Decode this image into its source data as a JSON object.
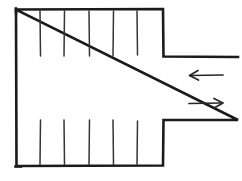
{
  "figure": {
    "style": "hand-drawn line sketch",
    "background_color": "#ffffff",
    "line_color": "#1b1b1b",
    "fin_color": "#343434",
    "arrow_color": "#262626",
    "canvas": {
      "width": 242,
      "height": 181
    }
  },
  "body_outline": {
    "name": "plenum-body",
    "left": 16,
    "top": 9,
    "right": 163,
    "bottom": 166,
    "description": "Large rectangular chamber open on the right into a narrow duct"
  },
  "duct": {
    "name": "outlet-duct",
    "upper_wall_y": 56,
    "lower_wall_y": 120,
    "start_x": 163,
    "end_x": 238,
    "description": "Narrow horizontal channel extending to the right edge"
  },
  "fins": {
    "top_group": {
      "label": "upper fin bank",
      "count": 5,
      "x_positions": [
        40,
        64,
        89,
        113,
        137
      ],
      "y_start": 11,
      "y_end": 56
    },
    "bottom_group": {
      "label": "lower fin bank",
      "count": 5,
      "x_positions": [
        40,
        64,
        89,
        113,
        137
      ],
      "y_start": 120,
      "y_end": 164
    }
  },
  "arrows": [
    {
      "name": "inlet-arrow",
      "direction": "left",
      "label": "",
      "x_tail": 223,
      "x_head": 189,
      "y": 75
    },
    {
      "name": "outlet-arrow",
      "direction": "right",
      "label": "",
      "x_tail": 189,
      "x_head": 223,
      "y": 103
    }
  ],
  "accessible_caption": "Hand-drawn cross-section of a finned chamber. A tall rectangle on the left has five short vertical fins descending from its top edge and five vertical fins rising from its bottom edge. The right side of the rectangle steps inward into a narrow horizontal duct that runs off the right edge of the image. Inside the duct region, an upper arrow points left and a lower arrow points right, indicating opposing flow directions."
}
